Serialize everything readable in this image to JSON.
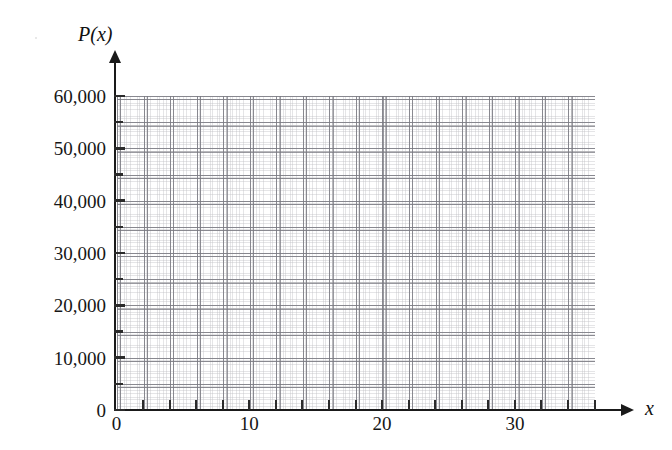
{
  "chart_data": {
    "type": "line",
    "title": "",
    "subtitle": "",
    "xlabel": "x",
    "ylabel": "P(x)",
    "xlim": [
      0,
      36
    ],
    "ylim": [
      0,
      60000
    ],
    "grid": true,
    "legend": null,
    "series": [],
    "annotations": [],
    "note": "Empty coordinate grid — no data plotted; blank graph for plotting P(x) against x",
    "x_ticks_major": [
      0,
      10,
      20,
      30
    ],
    "x_tick_labels": [
      "0",
      "10",
      "20",
      "30"
    ],
    "x_ticks_all": [
      0,
      2,
      4,
      6,
      8,
      10,
      12,
      14,
      16,
      18,
      20,
      22,
      24,
      26,
      28,
      30,
      32,
      34,
      36
    ],
    "x_tick_interval": 2,
    "y_ticks_major": [
      0,
      10000,
      20000,
      30000,
      40000,
      50000,
      60000
    ],
    "y_tick_labels": [
      "0",
      "10,000",
      "20,000",
      "30,000",
      "40,000",
      "50,000",
      "60,000"
    ],
    "y_ticks_all": [
      0,
      5000,
      10000,
      15000,
      20000,
      25000,
      30000,
      35000,
      40000,
      45000,
      50000,
      55000,
      60000
    ],
    "y_tick_interval": 5000,
    "grid_cell_x_units": 2,
    "grid_cell_y_units": 5000,
    "colors": {
      "background": "#ffffff",
      "axis": "#1a1a1a",
      "grid_major": "#8c8c90",
      "grid_minor": "#aaaaaf",
      "text": "#161616"
    }
  },
  "axes": {
    "y_title": "P(x)",
    "x_title": "x",
    "origin_label": "0"
  }
}
